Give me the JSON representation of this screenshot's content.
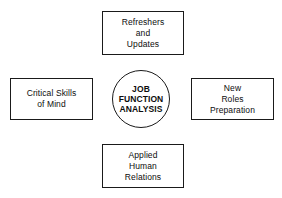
{
  "diagram": {
    "type": "hub-and-spoke",
    "center": {
      "id": "job-function-analysis",
      "shape": "circle",
      "label": "JOB\nFUNCTION\nANALYSIS"
    },
    "nodes": [
      {
        "id": "refreshers-and-updates",
        "position": "top",
        "shape": "rectangle",
        "label": "Refreshers\nand\nUpdates"
      },
      {
        "id": "critical-skills-of-mind",
        "position": "left",
        "shape": "rectangle",
        "label": "Critical Skills\nof Mind"
      },
      {
        "id": "new-roles-preparation",
        "position": "right",
        "shape": "rectangle",
        "label": "New\nRoles\nPreparation"
      },
      {
        "id": "applied-human-relations",
        "position": "bottom",
        "shape": "rectangle",
        "label": "Applied\nHuman\nRelations"
      }
    ],
    "colors": {
      "background": "#ffffff",
      "stroke": "#1a1a1a",
      "text": "#0d0d0d"
    }
  }
}
